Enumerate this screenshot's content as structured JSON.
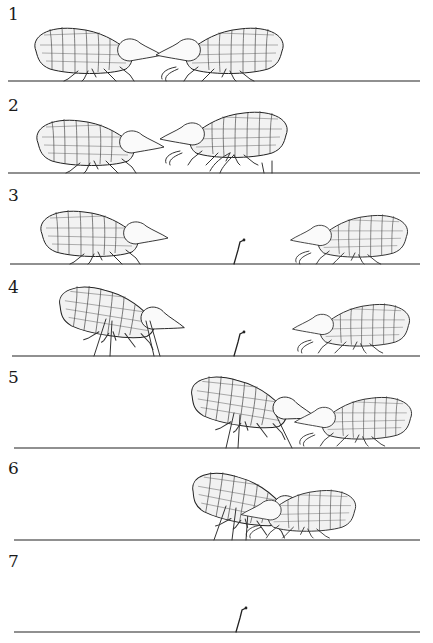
{
  "figure": {
    "colors": {
      "ink": "#222222",
      "paper": "#ffffff"
    },
    "panels": [
      {
        "label": "1",
        "ground_y": 81,
        "elements": [
          "springtail-left-facing-right",
          "springtail-right-facing-left"
        ]
      },
      {
        "label": "2",
        "ground_y": 173,
        "elements": [
          "springtail-left-facing-right",
          "springtail-right-raised-antennae"
        ]
      },
      {
        "label": "3",
        "ground_y": 264,
        "elements": [
          "springtail-left-facing-right",
          "spermatophore-stalk",
          "springtail-right-crouched"
        ]
      },
      {
        "label": "4",
        "ground_y": 356,
        "elements": [
          "springtail-left-raised",
          "spermatophore-stalk",
          "springtail-right-crouched"
        ]
      },
      {
        "label": "5",
        "ground_y": 448,
        "elements": [
          "springtail-center-raised",
          "springtail-right-crouched"
        ]
      },
      {
        "label": "6",
        "ground_y": 540,
        "elements": [
          "springtail-pair-overlapping"
        ]
      },
      {
        "label": "7",
        "ground_y": 631,
        "elements": [
          "spermatophore-stalk"
        ]
      }
    ]
  }
}
